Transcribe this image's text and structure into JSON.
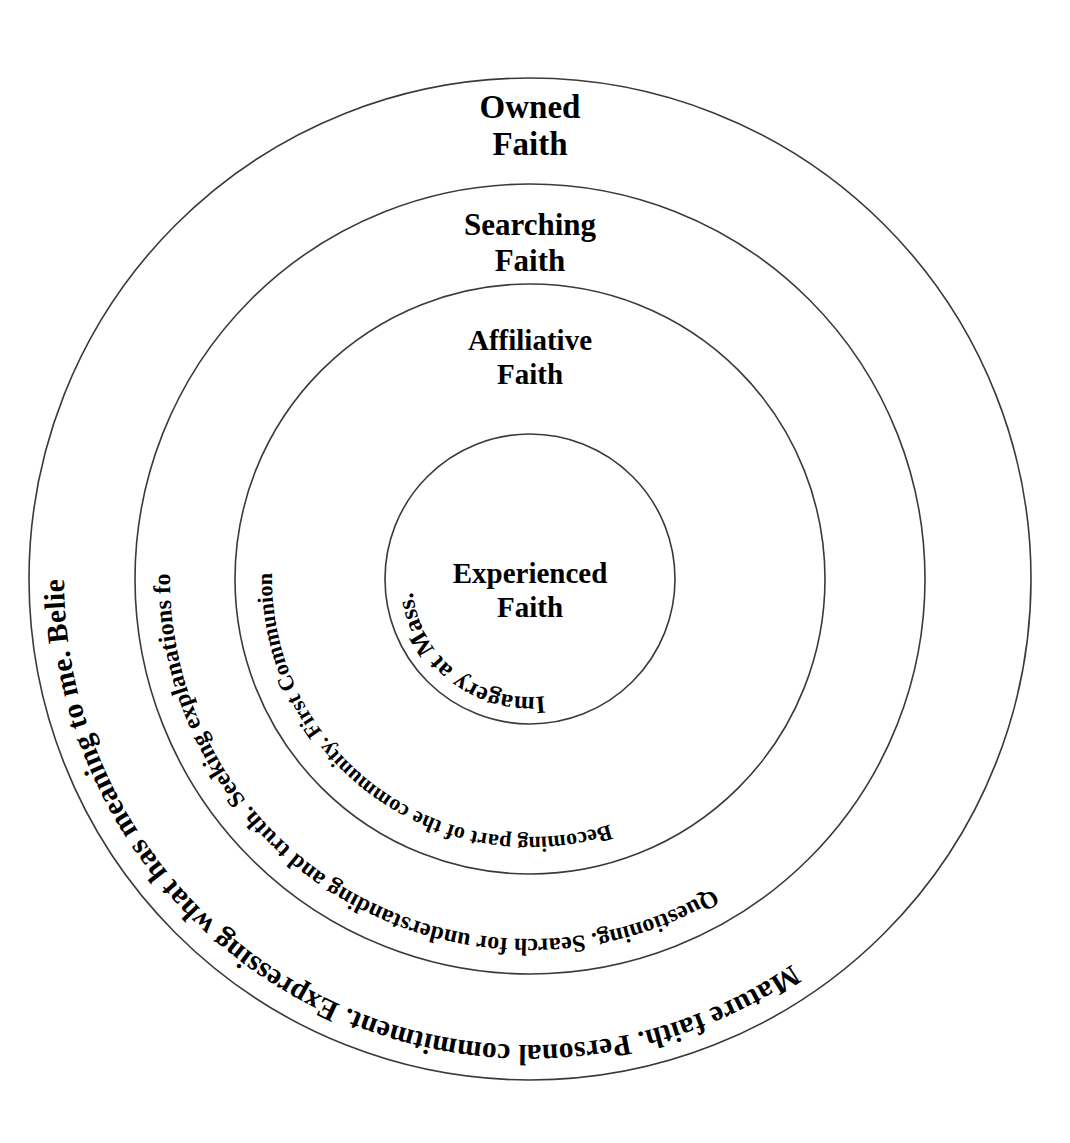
{
  "diagram": {
    "type": "concentric-circles",
    "background_color": "#ffffff",
    "stroke_color": "#3a3a3a",
    "text_color": "#000000",
    "center": {
      "x": 530,
      "y": 579
    },
    "rings": [
      {
        "id": "owned-faith",
        "index": 4,
        "stage_label_line1": "Owned",
        "stage_label_line2": "Faith",
        "radius": 501,
        "description": "Mature faith. Personal commitment. Expressing what has meaning to me. Belief put into action. Personal choice to follow religious tradition.",
        "descriptors": [
          "Mature faith.",
          "Personal commitment.",
          "Expressing what has meaning to me.",
          "Belief put into action.",
          "Personal choice to follow religious tradition."
        ],
        "label_y": 118
      },
      {
        "id": "searching-faith",
        "index": 3,
        "stage_label_line1": "Searching",
        "stage_label_line2": "Faith",
        "radius": 395,
        "description": "Questioning. Search for understanding and truth. Seeking explanations for experiences. Personal wrestling with faith. Experimentation with alternatives.",
        "descriptors": [
          "Questioning.",
          "Search for understanding and truth.",
          "Seeking explanations for experiences.",
          "Personal wrestling with faith.",
          "Experimentation with alternatives."
        ],
        "label_y": 235
      },
      {
        "id": "affiliative-faith",
        "index": 2,
        "stage_label_line1": "Affiliative",
        "stage_label_line2": "Faith",
        "radius": 295,
        "description": "Becoming part of the community. First Communion. Confirmation. Set of beliefs and values.",
        "descriptors": [
          "Becoming part of the community.",
          "First Communion.",
          "Confirmation.",
          "Set of beliefs and values."
        ],
        "label_y": 350
      },
      {
        "id": "experienced-faith",
        "index": 1,
        "stage_label_line1": "Experienced",
        "stage_label_line2": "Faith",
        "radius": 145,
        "description": "Imagery at Mass. Bible stories. Prayer at meals.",
        "descriptors": [
          "Imagery at Mass.",
          "Bible stories.",
          "Prayer at meals."
        ],
        "label_y": 583
      }
    ]
  }
}
